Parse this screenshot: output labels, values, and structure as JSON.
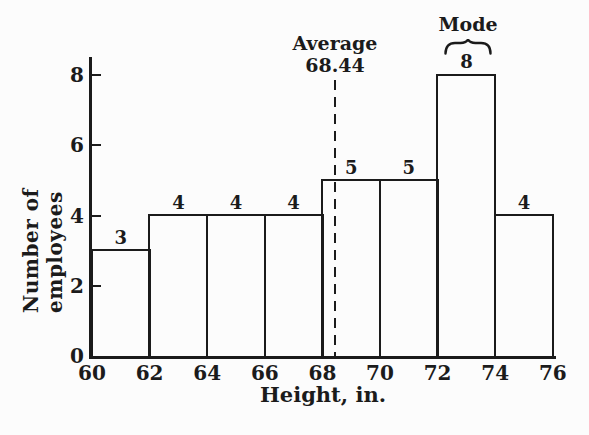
{
  "figure": {
    "background": "#fcfcfc",
    "ink": "#1b1b1b"
  },
  "chart_data": {
    "type": "bar",
    "subtype": "histogram",
    "title": "",
    "xlabel": "Height, in.",
    "ylabel": "Number of employees",
    "bin_edges": [
      60,
      62,
      64,
      66,
      68,
      70,
      72,
      74,
      76
    ],
    "values": [
      3,
      4,
      4,
      4,
      5,
      5,
      8,
      4
    ],
    "bar_labels": [
      "3",
      "4",
      "4",
      "4",
      "5",
      "5",
      "8",
      "4"
    ],
    "x_tick_labels": [
      "60",
      "62",
      "64",
      "66",
      "68",
      "70",
      "72",
      "74",
      "76"
    ],
    "y_ticks": [
      0,
      2,
      4,
      6,
      8
    ],
    "y_tick_labels": [
      "0",
      "2",
      "4",
      "6",
      "8"
    ],
    "xlim": [
      60,
      76
    ],
    "ylim": [
      0,
      8.5
    ],
    "grid": false,
    "legend": false,
    "annotations": {
      "average": {
        "label": "Average",
        "value_label": "68.44",
        "x": 68.44,
        "line_style": "dashed-vertical"
      },
      "mode": {
        "label": "Mode",
        "bin_start": 72,
        "bin_end": 74,
        "marker": "curly-brace-over-bar"
      }
    }
  }
}
